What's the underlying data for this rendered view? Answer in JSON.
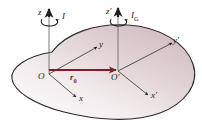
{
  "figure": {
    "name": "rigid-body-axes-diagram",
    "colors": {
      "body_fill_light": "#f6f2f2",
      "body_fill_dark": "#d9c9cc",
      "body_outline": "#2b2b2b",
      "axis_line": "#3a3a3a",
      "vector_color": "#7d1f2b",
      "background": "#ffffff"
    },
    "labels": {
      "z_axis": "z",
      "z_prime_axis": "z′",
      "x_axis": "x",
      "x_prime_axis": "x′",
      "y_axis": "y",
      "y_prime_axis": "y′",
      "origin_O": "O",
      "origin_O_prime": "O′",
      "inertia_I": "I",
      "inertia_IG_base": "I",
      "inertia_IG_sub": "G",
      "position_vector_base": "r",
      "position_vector_sub": "0"
    }
  }
}
